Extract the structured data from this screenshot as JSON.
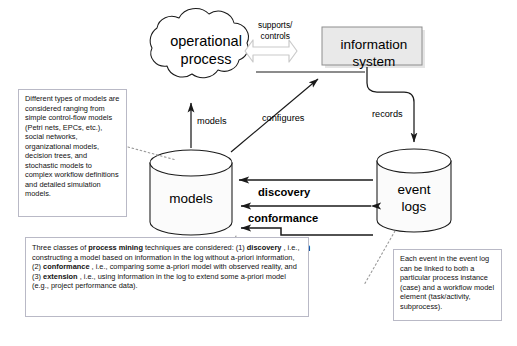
{
  "diagram": {
    "nodes": {
      "operational_process": "operational\nprocess",
      "operational_process_line1": "operational",
      "operational_process_line2": "process",
      "information_system_line1": "information",
      "information_system_line2": "system",
      "models": "models",
      "event_logs_line1": "event",
      "event_logs_line2": "logs"
    },
    "edge_labels": {
      "supports_controls_line1": "supports/",
      "supports_controls_line2": "controls",
      "models": "models",
      "configures": "configures",
      "records": "records",
      "discovery": "discovery",
      "conformance": "conformance",
      "extension": "extension"
    },
    "notes": {
      "left": "Different types of models are considered ranging from simple control-flow models (Petri nets, EPCs, etc.), social networks, organizational models, decision trees, and stochastic models to complex workflow definitions and detailed simulation models.",
      "bottom_parts": {
        "p1": "Three classes of ",
        "b1": "process mining",
        "p2": " techniques are considered: (1) ",
        "b2": "discovery",
        "p3": " , i.e., constructing a model based on information in the log without a-priori information, (2) ",
        "b3": "conformance",
        "p4": " , i.e., comparing some a-priori model with observed reality, and (3) ",
        "b4": "extension",
        "p5": " , i.e., using information in the log to extend some a-priori model (e.g., project performance data)."
      },
      "right": "Each event in the event log can be linked to both a particular process instance (case) and a workflow model element (task/activity, subprocess)."
    },
    "colors": {
      "stroke": "#1a1a1a",
      "note_border": "#b9b9c6",
      "infosys_fill": "#e8e8e8",
      "cylinder_fill": "#fafafa",
      "block_arrow_stroke": "#c8c8c8",
      "background": "#ffffff"
    }
  }
}
